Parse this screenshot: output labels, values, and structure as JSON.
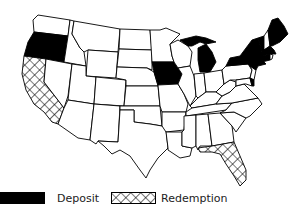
{
  "map": {
    "title": "",
    "region": "Contiguous United States",
    "colors": {
      "deposit": "#000000",
      "redemption_pattern": "crosshatch",
      "outline": "#000000",
      "background": "#ffffff"
    },
    "states": {
      "deposit": [
        "Oregon",
        "Iowa",
        "Michigan",
        "New York",
        "Vermont",
        "Maine",
        "Massachusetts",
        "Connecticut",
        "Delaware"
      ],
      "redemption": [
        "California",
        "Florida"
      ]
    }
  },
  "legend": {
    "items": [
      {
        "key": "deposit",
        "label": "Deposit",
        "fill": "solid-black"
      },
      {
        "key": "redemption",
        "label": "Redemption",
        "fill": "crosshatch"
      }
    ]
  }
}
